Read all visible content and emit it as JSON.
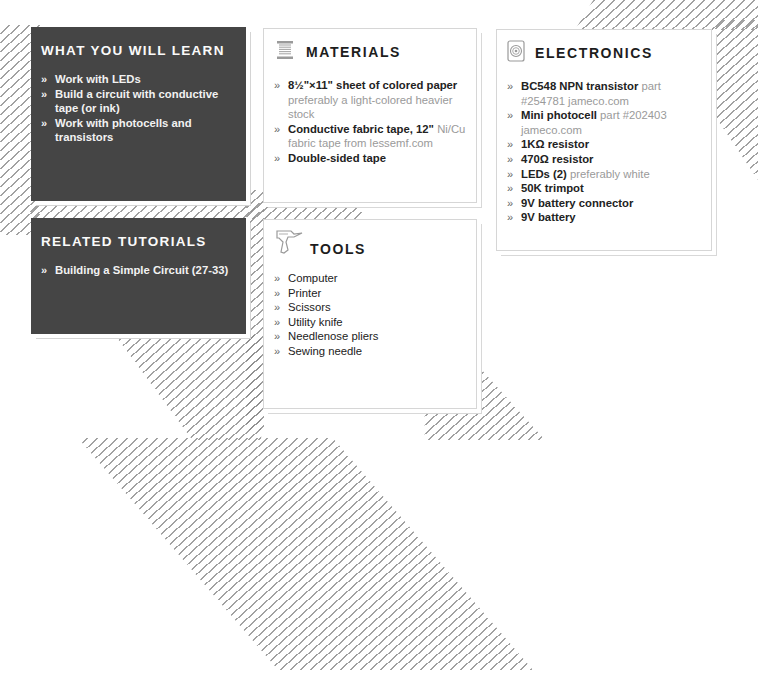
{
  "colors": {
    "dark_card": "#454545",
    "hatch": "#8a8a8a",
    "note_text": "#9a9a9a"
  },
  "what_you_will_learn": {
    "title": "WHAT YOU WILL LEARN",
    "bullet": "»",
    "items": [
      "Work with LEDs",
      "Build a circuit with conductive tape (or ink)",
      "Work with photocells and transistors"
    ]
  },
  "related_tutorials": {
    "title": "RELATED TUTORIALS",
    "bullet": "»",
    "items": [
      "Building a Simple Circuit (27-33)"
    ]
  },
  "materials": {
    "title": "MATERIALS",
    "icon": "spool-icon",
    "bullet": "»",
    "items": [
      {
        "main": "8½\"×11\" sheet of colored paper",
        "note": "preferably a light-colored heavier stock"
      },
      {
        "main": "Conductive fabric tape, 12\"",
        "note": "Ni/Cu fabric tape from lessemf.com"
      },
      {
        "main": "Double-sided tape",
        "note": ""
      }
    ]
  },
  "tools": {
    "title": "TOOLS",
    "icon": "drill-icon",
    "bullet": "»",
    "items": [
      "Computer",
      "Printer",
      "Scissors",
      "Utility knife",
      "Needlenose pliers",
      "Sewing needle"
    ]
  },
  "electronics": {
    "title": "ELECTRONICS",
    "icon": "speaker-icon",
    "bullet": "»",
    "items": [
      {
        "main": "BC548 NPN transistor",
        "note": "part #254781 jameco.com"
      },
      {
        "main": "Mini photocell",
        "note": "part #202403 jameco.com"
      },
      {
        "main": "1KΩ resistor",
        "note": ""
      },
      {
        "main": "470Ω resistor",
        "note": ""
      },
      {
        "main": "LEDs (2)",
        "note": "preferably white"
      },
      {
        "main": "50K trimpot",
        "note": ""
      },
      {
        "main": "9V battery connector",
        "note": ""
      },
      {
        "main": "9V battery",
        "note": ""
      }
    ]
  }
}
